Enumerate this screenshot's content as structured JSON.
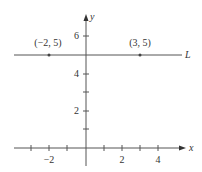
{
  "diagram": {
    "type": "coordinate-plane",
    "axes": {
      "x_label": "x",
      "y_label": "y",
      "x_tick_labels": [
        "−2",
        "2",
        "4"
      ],
      "y_tick_labels": [
        "2",
        "4",
        "6"
      ]
    },
    "line": {
      "label": "L",
      "equation_y": 5,
      "orientation": "horizontal"
    },
    "points": [
      {
        "label": "(−2, 5)",
        "x": -2,
        "y": 5
      },
      {
        "label": "(3, 5)",
        "x": 3,
        "y": 5
      }
    ],
    "colors": {
      "axis": "#555555",
      "line": "#555555",
      "text": "#333333"
    }
  }
}
